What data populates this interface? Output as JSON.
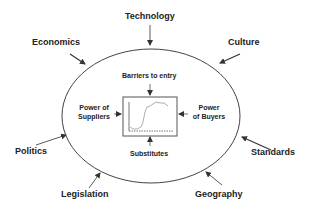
{
  "diagram": {
    "center_chart": {
      "label": "industry-performance-curve"
    },
    "inner_forces": {
      "top": "Barriers to entry",
      "left_line1": "Power of",
      "left_line2": "Suppliers",
      "right_line1": "Power",
      "right_line2": "of Buyers",
      "bottom": "Substitutes"
    },
    "outer_forces": {
      "technology": "Technology",
      "economics": "Economics",
      "culture": "Culture",
      "politics": "Politics",
      "standards": "Standards",
      "legislation": "Legislation",
      "geography": "Geography"
    },
    "colors": {
      "line": "#333333",
      "text": "#222222",
      "chart_curve": "#999999"
    }
  }
}
